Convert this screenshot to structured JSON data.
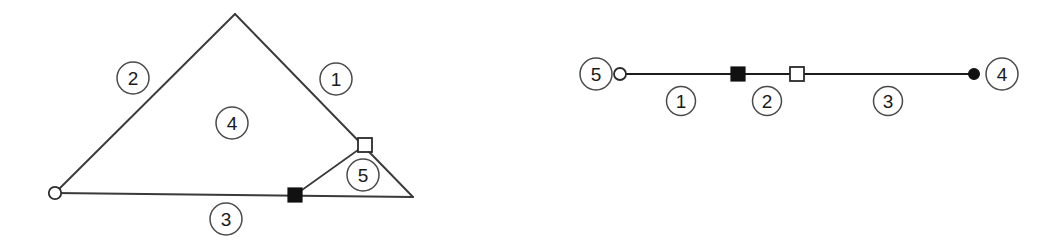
{
  "figure": {
    "background_color": "#ffffff",
    "line_color": "#3a3a3a",
    "marker_fill_dark": "#111111",
    "marker_fill_light": "#ffffff",
    "label_text_color": "#1a1a1a"
  },
  "left_diagram": {
    "name": "triangle-network",
    "nodes": [
      {
        "id": "left-vertex",
        "marker": "open-circle",
        "x": 55,
        "y": 193
      },
      {
        "id": "apex-vertex",
        "marker": "none",
        "x": 235,
        "y": 14
      },
      {
        "id": "right-vertex",
        "marker": "none",
        "x": 413,
        "y": 197
      },
      {
        "id": "baseline-node",
        "marker": "filled-square",
        "x": 295,
        "y": 195
      },
      {
        "id": "right-edge-node",
        "marker": "open-square",
        "x": 365,
        "y": 145
      }
    ],
    "edges": [
      {
        "id": "edge-left-apex",
        "from": "left-vertex",
        "to": "apex-vertex"
      },
      {
        "id": "edge-apex-right",
        "from": "apex-vertex",
        "to": "right-vertex"
      },
      {
        "id": "edge-baseline",
        "from": "left-vertex",
        "to": "right-vertex"
      },
      {
        "id": "edge-inner-diagonal",
        "from": "baseline-node",
        "to": "right-edge-node"
      }
    ],
    "labels": [
      {
        "id": "label-1",
        "text": "1",
        "x": 336,
        "y": 79,
        "r": 16
      },
      {
        "id": "label-2",
        "text": "2",
        "x": 133,
        "y": 78,
        "r": 16
      },
      {
        "id": "label-3",
        "text": "3",
        "x": 226,
        "y": 219,
        "r": 16
      },
      {
        "id": "label-4",
        "text": "4",
        "x": 232,
        "y": 123,
        "r": 16
      },
      {
        "id": "label-5",
        "text": "5",
        "x": 363,
        "y": 175,
        "r": 16
      }
    ]
  },
  "right_diagram": {
    "name": "linear-path",
    "axis_y": 74,
    "nodes": [
      {
        "id": "path-start",
        "marker": "open-circle",
        "x": 620,
        "y": 74
      },
      {
        "id": "path-mid-1",
        "marker": "filled-square",
        "x": 738,
        "y": 74
      },
      {
        "id": "path-mid-2",
        "marker": "open-square",
        "x": 797,
        "y": 74
      },
      {
        "id": "path-end",
        "marker": "filled-circle",
        "x": 974,
        "y": 74
      }
    ],
    "segments": [
      {
        "id": "segment-1",
        "from": "path-start",
        "to": "path-mid-1"
      },
      {
        "id": "segment-2",
        "from": "path-mid-1",
        "to": "path-mid-2"
      },
      {
        "id": "segment-3",
        "from": "path-mid-2",
        "to": "path-end"
      }
    ],
    "endpoint_labels": [
      {
        "id": "label-5",
        "text": "5",
        "x": 596,
        "y": 74,
        "r": 16
      },
      {
        "id": "label-4",
        "text": "4",
        "x": 1002,
        "y": 74,
        "r": 16
      }
    ],
    "segment_labels": [
      {
        "id": "label-1",
        "text": "1",
        "x": 681,
        "y": 101,
        "r": 14
      },
      {
        "id": "label-2",
        "text": "2",
        "x": 767,
        "y": 101,
        "r": 14
      },
      {
        "id": "label-3",
        "text": "3",
        "x": 888,
        "y": 101,
        "r": 14
      }
    ]
  }
}
